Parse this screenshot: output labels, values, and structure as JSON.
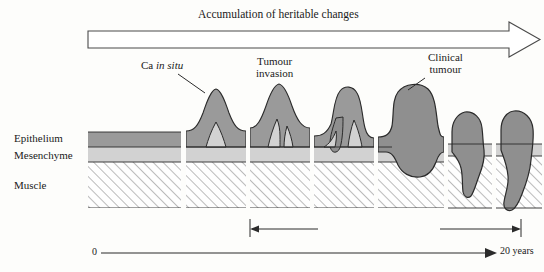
{
  "figure": {
    "title_arrow_label": "Accumulation of heritable changes",
    "background_color": "#fdfdfb",
    "ink_color": "#1a1a1a"
  },
  "legend_labels": {
    "epithelium": "Epithelium",
    "mesenchyme": "Mesenchyme",
    "muscle": "Muscle"
  },
  "layer_colors": {
    "epithelium_fill": "#9a9a9a",
    "mesenchyme_fill": "#d2d2d2",
    "muscle_fill": "#fefefe",
    "muscle_hatch": "#9a9a9a",
    "tumour_fill": "#8f8f8f",
    "outline": "#2b2b2b"
  },
  "callouts": [
    {
      "id": "ca-in-situ",
      "line1": "Ca ",
      "line1_italic": "in situ",
      "line2": ""
    },
    {
      "id": "tumour-invasion",
      "line1": "Tumour",
      "line2": "invasion"
    },
    {
      "id": "clinical-tumour",
      "line1": "Clinical",
      "line2": "tumour"
    }
  ],
  "metastasis": {
    "label": "Metastasis possible"
  },
  "timeline": {
    "start_label": "0",
    "end_label": "20 years"
  },
  "panels": [
    {
      "index": 1,
      "name": "normal-epithelium",
      "stage": "normal"
    },
    {
      "index": 2,
      "name": "carcinoma-in-situ",
      "stage": "in situ"
    },
    {
      "index": 3,
      "name": "early-invasion",
      "stage": "invasion"
    },
    {
      "index": 4,
      "name": "tumour-invasion",
      "stage": "invasion"
    },
    {
      "index": 5,
      "name": "clinical-tumour",
      "stage": "clinical"
    },
    {
      "index": 6,
      "name": "muscle-invasion",
      "stage": "metastatic"
    },
    {
      "index": 7,
      "name": "deep-muscle-breach",
      "stage": "metastatic"
    }
  ]
}
